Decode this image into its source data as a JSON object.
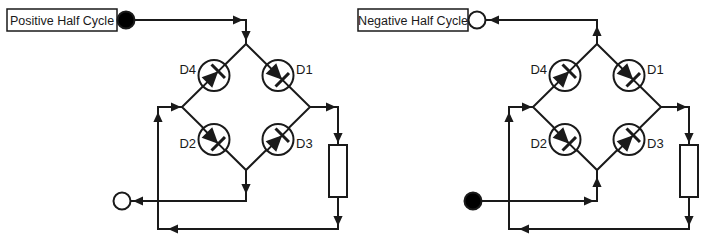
{
  "page": {
    "background": "#ffffff",
    "line_color": "#1a1a1a"
  },
  "panels": [
    {
      "id": "positive",
      "label": "Positive Half Cycle",
      "terminals": {
        "top_fill": "#000000",
        "bottom_fill": "#ffffff"
      },
      "diodes": {
        "d1": "D1",
        "d2": "D2",
        "d3": "D3",
        "d4": "D4"
      }
    },
    {
      "id": "negative",
      "label": "Negative Half Cycle",
      "terminals": {
        "top_fill": "#ffffff",
        "bottom_fill": "#000000"
      },
      "diodes": {
        "d1": "D1",
        "d2": "D2",
        "d3": "D3",
        "d4": "D4"
      }
    }
  ]
}
